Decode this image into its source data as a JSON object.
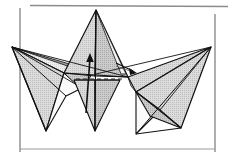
{
  "figure": {
    "title": "Origami folding diagram — three-point star model",
    "background_color": "#ffffff",
    "ink_color": "#111111",
    "shade_light": "#e6e6e6",
    "shade_mid": "#cfcfcf",
    "shade_dark": "#b8b8b8",
    "paper_white": "#fbfbfb",
    "rule_color": "#8c8c8c"
  },
  "page_rules": {
    "top_rule": {
      "x1": 30,
      "y1": 5,
      "x2": 228,
      "y2": 6,
      "color": "#8c8c8c",
      "width": 1.6
    },
    "left_rule": {
      "x1": 20,
      "y1": 8,
      "x2": 20,
      "y2": 152,
      "color": "#8c8c8c",
      "width": 1.4
    },
    "right_rule": {
      "x1": 215,
      "y1": 14,
      "x2": 215,
      "y2": 152,
      "color": "#8c8c8c",
      "width": 1.4
    },
    "bottom_rule": {
      "x1": 20,
      "y1": 149,
      "x2": 215,
      "y2": 149,
      "color": "#8c8c8c",
      "width": 1.2
    }
  },
  "model": {
    "center_spike": {
      "name": "center-spike",
      "apex": [
        96,
        10
      ],
      "bottom_tip": [
        95,
        131
      ],
      "left_base": [
        64,
        73
      ],
      "right_base": [
        128,
        77
      ],
      "fill": "#d2d2d2"
    },
    "left_wing": {
      "name": "left-wing",
      "tip": [
        12,
        47
      ],
      "lower_tip": [
        46,
        131
      ],
      "inner_join": [
        92,
        74
      ],
      "fill": "#d2d2d2"
    },
    "right_wing": {
      "name": "right-wing",
      "tip": [
        211,
        47
      ],
      "lower_tip_left": [
        136,
        134
      ],
      "lower_tip_right": [
        181,
        128
      ],
      "inner_join": [
        128,
        77
      ],
      "fill": "#d2d2d2"
    }
  },
  "annotations": {
    "fold_arrow": {
      "name": "fold-direction-arrow",
      "from": [
        86,
        112
      ],
      "to": [
        90,
        55
      ],
      "head_size": 5,
      "color": "#111111"
    },
    "dashed_crease": {
      "name": "dashed-crease-line",
      "x1": 76,
      "y1": 79,
      "x2": 124,
      "y2": 79,
      "dash": "4 3",
      "color": "#222222"
    },
    "small_arrow": {
      "name": "small-fold-arrow",
      "from": [
        118,
        64
      ],
      "to": [
        134,
        72
      ],
      "color": "#111111"
    }
  }
}
